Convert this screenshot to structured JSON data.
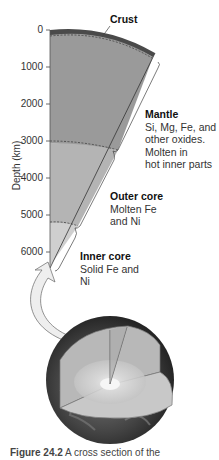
{
  "figure": {
    "labels": {
      "crust": "Crust",
      "mantle_title": "Mantle",
      "mantle_desc": [
        "Si, Mg, Fe, and",
        "other oxides.",
        "Molten in",
        "hot inner parts"
      ],
      "outer_core_title": "Outer core",
      "outer_core_desc": [
        "Molten Fe",
        "and Ni"
      ],
      "inner_core_title": "Inner core",
      "inner_core_desc": [
        "Solid Fe and",
        "Ni"
      ]
    },
    "axis": {
      "ylabel": "Depth (km)",
      "ticks": [
        "0",
        "1000",
        "2000",
        "3000",
        "4000",
        "5000",
        "6000"
      ]
    },
    "caption": {
      "bold": "Figure 24.2",
      "text": " A cross section of the"
    },
    "colors": {
      "crust": "#4a4a4a",
      "mantle": "#9a9a9a",
      "outer_core": "#b4b4b4",
      "inner_core": "#cfcfcf",
      "arrow": "#ececec"
    }
  }
}
